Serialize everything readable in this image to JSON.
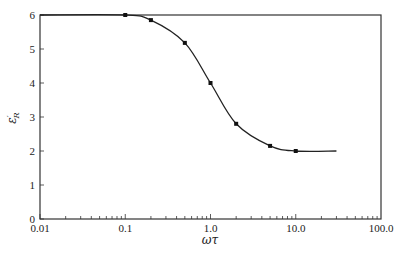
{
  "chart_data": {
    "type": "line",
    "title": "",
    "xlabel": "ωτ",
    "ylabel": "ε′R",
    "xscale": "log",
    "xlim": [
      0.01,
      100.0
    ],
    "ylim": [
      0,
      6
    ],
    "grid": false,
    "legend": null,
    "x_ticks": [
      "0.01",
      "0.1",
      "1.0",
      "10.0",
      "100.0"
    ],
    "y_ticks": [
      "0",
      "1",
      "2",
      "3",
      "4",
      "5",
      "6"
    ],
    "series": [
      {
        "name": "ε′R",
        "x": [
          0.01,
          0.1,
          0.2,
          0.5,
          1.0,
          2.0,
          5.0,
          10.0,
          30.0
        ],
        "values": [
          6.0,
          6.0,
          5.85,
          5.18,
          4.0,
          2.8,
          2.15,
          2.0,
          2.0
        ],
        "markers_at": [
          0.1,
          0.2,
          0.5,
          1.0,
          2.0,
          5.0,
          10.0
        ]
      }
    ]
  },
  "labels": {
    "xlabel": "ωτ",
    "ylabel_main": "ε",
    "ylabel_prime": "′",
    "ylabel_sub": "R"
  }
}
